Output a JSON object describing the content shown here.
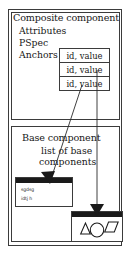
{
  "figure": {
    "background_color": "#ffffff",
    "line_color": "#3b3b3b",
    "text_color": "#171717",
    "fill_dark": "#1a1a1a"
  },
  "composite_panel": {
    "heading": "Composite component",
    "attributes_label": "Attributes",
    "pspec_label": "PSpec",
    "anchors_label": "Anchors",
    "anchor_rows": [
      {
        "text": "id, value"
      },
      {
        "text": "id, value"
      },
      {
        "text": "id, value"
      }
    ]
  },
  "base_panel": {
    "heading": "Base component",
    "list_line_1": "list of base",
    "list_line_2": "components",
    "left_window": {
      "text_line_1": "sgdsg",
      "text_line_2": "idtj h"
    },
    "right_window": {
      "shapes": [
        "triangle",
        "circle",
        "parallelogram"
      ]
    }
  },
  "connectors": [
    {
      "name": "anchor-3-to-left-window",
      "from": "anchor_row_3",
      "to": "left_window_titlebar",
      "style": "diagonal-arrow"
    },
    {
      "name": "anchor-2-to-right-window",
      "from": "anchor_row_2",
      "to": "right_window_titlebar",
      "style": "vertical-arrow"
    }
  ]
}
